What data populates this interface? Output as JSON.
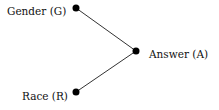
{
  "diagram": {
    "type": "graph",
    "nodes": [
      {
        "id": "G",
        "label": "Gender (G)",
        "x": 76,
        "y": 8
      },
      {
        "id": "A",
        "label": "Answer (A)",
        "x": 136,
        "y": 51
      },
      {
        "id": "R",
        "label": "Race (R)",
        "x": 76,
        "y": 92
      }
    ],
    "edges": [
      {
        "from": "G",
        "to": "A"
      },
      {
        "from": "R",
        "to": "A"
      }
    ],
    "colors": {
      "node": "#000000",
      "edge": "#333333",
      "text": "#111111"
    }
  }
}
